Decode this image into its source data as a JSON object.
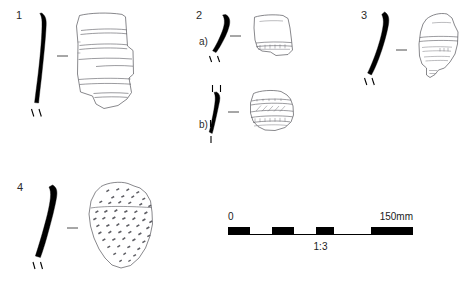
{
  "plate": {
    "title_visible": false,
    "background_color": "#ffffff",
    "ink_color": "#000000",
    "figures": [
      {
        "number": "1",
        "sub_label": "",
        "profile": "curved-thin-wall-section",
        "sherd": "body-sherd-with-horizontal-incised-bands",
        "decoration": "horizontal parallel incised lines"
      },
      {
        "number": "2",
        "sub_label": "a)",
        "profile": "short-curved-rim-section",
        "sherd": "body-sherd-with-lower-banded-zone",
        "decoration": "horizontal banded zone near base"
      },
      {
        "number": "",
        "sub_label": "b)",
        "profile": "straight-thick-wall-section",
        "sherd": "body-sherd-with-hatched-bands",
        "decoration": "horizontal bands with oblique hatching"
      },
      {
        "number": "3",
        "sub_label": "",
        "profile": "long-curved-wall-section",
        "sherd": "angular-sherd-with-faint-horizontal-lines",
        "decoration": "faint horizontal incised lines"
      },
      {
        "number": "4",
        "sub_label": "",
        "profile": "long-curved-tapering-section",
        "sherd": "sherd-with-dense-impressed-dashes",
        "decoration": "dense field of short impressed dashes"
      }
    ]
  },
  "scale": {
    "start_label": "0",
    "end_label": "150mm",
    "ratio_label": "1:3",
    "units": "mm",
    "total_length_mm": 150,
    "segments": 6,
    "segment_length_mm": 25
  }
}
